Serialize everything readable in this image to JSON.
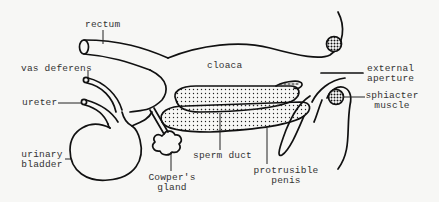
{
  "diagram": {
    "title": "",
    "colors": {
      "ink": "#111111",
      "background": "#f7f7f5",
      "label": "#333333"
    },
    "labels": {
      "rectum": "rectum",
      "vas_deferens": "vas deferens",
      "ureter": "ureter",
      "urinary_bladder_1": "urinary",
      "urinary_bladder_2": "bladder",
      "cloaca": "cloaca",
      "external_aperture_1": "external",
      "external_aperture_2": "aperture",
      "sphincter_muscle_1": "sphiacter",
      "sphincter_muscle_2": "muscle",
      "sperm_duct": "sperm duct",
      "cowpers_gland_1": "Cowper's",
      "cowpers_gland_2": "gland",
      "protrusible_penis_1": "protrusible",
      "protrusible_penis_2": "penis"
    }
  }
}
